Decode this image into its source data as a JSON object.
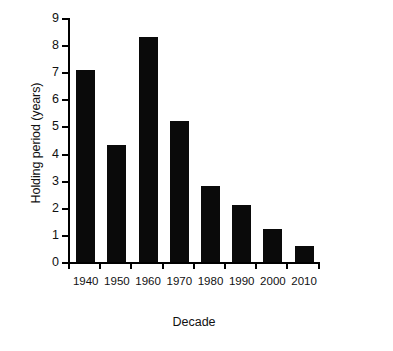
{
  "chart_data": {
    "type": "bar",
    "title": "",
    "xlabel": "Decade",
    "ylabel": "Holding period (years)",
    "categories": [
      "1940",
      "1950",
      "1960",
      "1970",
      "1980",
      "1990",
      "2000",
      "2010"
    ],
    "values": [
      7.1,
      4.3,
      8.3,
      5.2,
      2.8,
      2.1,
      1.2,
      0.6
    ],
    "ylim": [
      0,
      9
    ],
    "yticks": [
      0,
      1,
      2,
      3,
      4,
      5,
      6,
      7,
      8,
      9
    ],
    "ytick_labels": [
      "0",
      "1",
      "2",
      "3",
      "4",
      "5",
      "6",
      "7",
      "8",
      "9"
    ],
    "grid": false,
    "legend": false,
    "bar_color": "#0a0a0a",
    "axis_color": "#000000",
    "background": "#ffffff"
  }
}
